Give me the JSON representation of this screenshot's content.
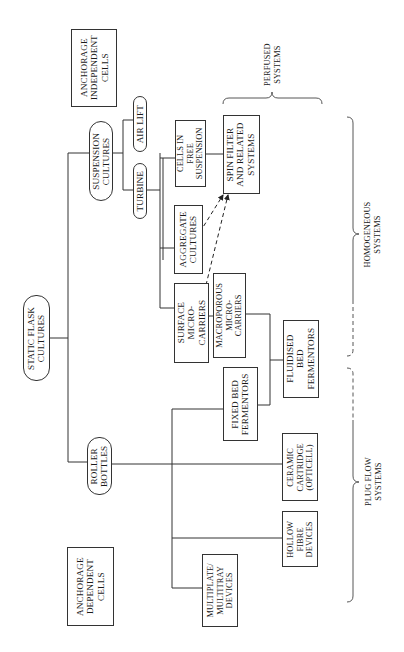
{
  "diagram": {
    "orientation": "rotated-90-ccw",
    "nodes": {
      "anchorage_independent": {
        "label": "ANCHORAGE\nINDEPENDENT\nCELLS",
        "shape": "box"
      },
      "suspension_cultures": {
        "label": "SUSPENSION\nCULTURES",
        "shape": "pill"
      },
      "air_lift": {
        "label": "AIR LIFT",
        "shape": "pill"
      },
      "turbine": {
        "label": "TURBINE",
        "shape": "pill"
      },
      "cells_free_suspension": {
        "label": "CELLS IN\nFREE\nSUSPENSION",
        "shape": "box"
      },
      "spin_filter": {
        "label": "SPIN FILTER\nAND RELATED\nSYSTEMS",
        "shape": "box"
      },
      "aggregate_cultures": {
        "label": "AGGREGATE\nCULTURES",
        "shape": "box"
      },
      "surface_microcarriers": {
        "label": "SURFACE\nMICRO-\nCARRIERS",
        "shape": "box"
      },
      "macroporous_microcarriers": {
        "label": "MACROPOROUS\nMICRO-\nCARRIERS",
        "shape": "box"
      },
      "fluidised_bed": {
        "label": "FLUIDISED\nBED\nFERMENTORS",
        "shape": "box"
      },
      "fixed_bed": {
        "label": "FIXED BED\nFERMENTORS",
        "shape": "box"
      },
      "static_flask": {
        "label": "STATIC FLASK\nCULTURES",
        "shape": "pill"
      },
      "roller_bottles": {
        "label": "ROLLER\nBOTTLES",
        "shape": "pill"
      },
      "ceramic_cartridge": {
        "label": "CERAMIC\nCARTRIDGE\n(OPTICELL)",
        "shape": "box"
      },
      "hollow_fibre": {
        "label": "HOLLOW\nFIBRE\nDEVICES",
        "shape": "box"
      },
      "multiplate": {
        "label": "MULTIPLATE/\nMULTITRAY\nDEVICES",
        "shape": "box"
      },
      "anchorage_dependent": {
        "label": "ANCHORAGE\nDEPENDENT\nCELLS",
        "shape": "box"
      }
    },
    "groups": {
      "perfused": {
        "label": "PERFUSED\nSYSTEMS"
      },
      "homogeneous": {
        "label": "HOMOGENEOUS\nSYSTEMS"
      },
      "plug_flow": {
        "label": "PLUG FLOW\nSYSTEMS"
      }
    },
    "edges": [
      {
        "from": "static_flask",
        "to": "suspension_cultures",
        "style": "solid"
      },
      {
        "from": "static_flask",
        "to": "roller_bottles",
        "style": "solid"
      },
      {
        "from": "suspension_cultures",
        "to": "air_lift",
        "style": "solid"
      },
      {
        "from": "suspension_cultures",
        "to": "turbine",
        "style": "solid"
      },
      {
        "from": "turbine",
        "to": "cells_free_suspension",
        "style": "solid"
      },
      {
        "from": "turbine",
        "to": "aggregate_cultures",
        "style": "solid"
      },
      {
        "from": "turbine",
        "to": "surface_microcarriers",
        "style": "solid"
      },
      {
        "from": "cells_free_suspension",
        "to": "spin_filter",
        "style": "solid"
      },
      {
        "from": "aggregate_cultures",
        "to": "spin_filter",
        "style": "dashed-arrow"
      },
      {
        "from": "surface_microcarriers",
        "to": "spin_filter",
        "style": "dashed-arrow"
      },
      {
        "from": "surface_microcarriers",
        "to": "macroporous_microcarriers",
        "style": "solid"
      },
      {
        "from": "macroporous_microcarriers",
        "to": "fluidised_bed",
        "style": "solid"
      },
      {
        "from": "fixed_bed",
        "to": "fluidised_bed",
        "style": "solid"
      },
      {
        "from": "roller_bottles",
        "to": "fixed_bed",
        "style": "solid"
      },
      {
        "from": "roller_bottles",
        "to": "ceramic_cartridge",
        "style": "solid"
      },
      {
        "from": "roller_bottles",
        "to": "hollow_fibre",
        "style": "solid"
      },
      {
        "from": "roller_bottles",
        "to": "multiplate",
        "style": "solid"
      }
    ]
  },
  "colors": {
    "line": "#333333",
    "text": "#1a1a1a",
    "background": "#ffffff"
  }
}
